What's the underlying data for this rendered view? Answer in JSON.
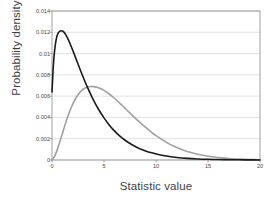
{
  "chart_data": {
    "type": "line",
    "title": "",
    "xlabel": "Statistic value",
    "ylabel": "Probability density",
    "xlim": [
      0,
      20
    ],
    "ylim": [
      0,
      0.014
    ],
    "xticks": [
      0,
      5,
      10,
      15,
      20
    ],
    "xtick_labels": [
      "0",
      "5",
      "10",
      "15",
      "20"
    ],
    "yticks": [
      0,
      0.002,
      0.004,
      0.006,
      0.008,
      0.01,
      0.012,
      0.014
    ],
    "ytick_labels": [
      "0",
      "0.002",
      "0.004",
      "0.006",
      "0.008",
      "0.01",
      "0.012",
      "0.014"
    ],
    "grid": "horizontal",
    "legend": "none",
    "plot_border": true,
    "series": [
      {
        "name": "null-distribution",
        "color": "#1a1a1a",
        "linewidth": 1.6,
        "x": [
          0.0,
          0.15,
          0.3,
          0.45,
          0.6,
          0.8,
          1.0,
          1.1,
          1.3,
          1.5,
          1.8,
          2.1,
          2.5,
          3.0,
          3.5,
          4.0,
          4.5,
          5.0,
          5.5,
          6.0,
          6.5,
          7.0,
          7.5,
          8.0,
          8.5,
          9.0,
          9.5,
          10.0,
          11.0,
          12.0,
          13.0,
          14.0,
          15.0,
          16.0,
          17.0,
          18.0,
          19.0,
          20.0
        ],
        "y": [
          0.0064,
          0.0092,
          0.0107,
          0.01155,
          0.01195,
          0.01213,
          0.01212,
          0.01206,
          0.01181,
          0.01145,
          0.01078,
          0.01004,
          0.00902,
          0.00778,
          0.00663,
          0.00561,
          0.00472,
          0.00396,
          0.0033,
          0.00274,
          0.00227,
          0.00188,
          0.00155,
          0.00127,
          0.00104,
          0.00085,
          0.0007,
          0.00057,
          0.00037,
          0.00024,
          0.000155,
          0.0001,
          6.4e-05,
          4.1e-05,
          2.6e-05,
          1.7e-05,
          1.1e-05,
          7e-06
        ]
      },
      {
        "name": "alternative-distribution",
        "color": "#a0a0a0",
        "linewidth": 1.6,
        "x": [
          0.0,
          0.25,
          0.5,
          0.75,
          1.0,
          1.5,
          2.0,
          2.5,
          3.0,
          3.5,
          4.0,
          4.3,
          4.6,
          5.0,
          5.5,
          6.0,
          6.5,
          7.0,
          7.5,
          8.0,
          8.5,
          9.0,
          9.5,
          10.0,
          11.0,
          12.0,
          13.0,
          14.0,
          15.0,
          16.0,
          17.0,
          18.0,
          19.0,
          20.0
        ],
        "y": [
          2e-05,
          0.00035,
          0.00095,
          0.0017,
          0.0025,
          0.00404,
          0.00527,
          0.00613,
          0.00665,
          0.00688,
          0.00689,
          0.00684,
          0.00674,
          0.00654,
          0.0062,
          0.0058,
          0.00535,
          0.00488,
          0.00441,
          0.00394,
          0.00349,
          0.00306,
          0.00266,
          0.00229,
          0.00166,
          0.00117,
          0.0008,
          0.00054,
          0.00035,
          0.00023,
          0.00014,
          9e-05,
          5e-05,
          3e-05
        ]
      }
    ]
  },
  "axes": {
    "plot_left_px": 52,
    "plot_right_px": 260,
    "plot_top_px": 11,
    "plot_bottom_px": 160
  },
  "colors": {
    "axis": "#8a8a8a",
    "grid": "#d6d6d6",
    "series_primary": "#1a1a1a",
    "series_secondary": "#a0a0a0",
    "text": "#3f3f3f",
    "background": "#ffffff"
  }
}
